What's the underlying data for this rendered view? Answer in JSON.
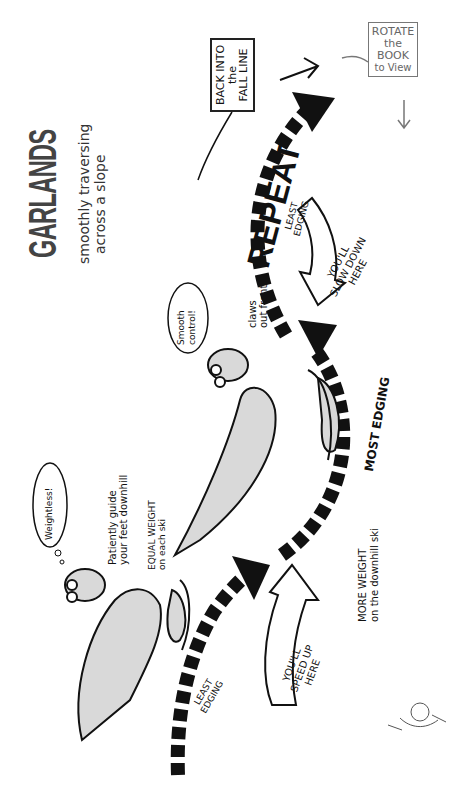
{
  "title": {
    "heading": "GARLANDS",
    "subtitle_line1": "smoothly traversing",
    "subtitle_line2": "across a slope"
  },
  "boxes": {
    "back_into_l1": "BACK INTO",
    "back_into_l2": "the",
    "back_into_l3": "FALL LINE",
    "rotate_l1": "ROTATE",
    "rotate_l2": "the",
    "rotate_l3": "BOOK",
    "rotate_l4": "to View"
  },
  "labels": {
    "repeat": "REPEAT",
    "least_edging_top_l1": "LEAST",
    "least_edging_top_l2": "EDGING",
    "slow_down_l1": "YOU'LL",
    "slow_down_l2": "SLOW DOWN",
    "slow_down_l3": "HERE",
    "most_edging": "MOST EDGING",
    "more_weight_l1": "MORE WEIGHT",
    "more_weight_l2": "on the downhill ski",
    "speed_up_l1": "YOU'LL",
    "speed_up_l2": "SPEED UP",
    "speed_up_l3": "HERE",
    "least_edging_bottom_l1": "LEAST",
    "least_edging_bottom_l2": "EDGING",
    "claws_l1": "claws",
    "claws_l2": "out front",
    "smooth_l1": "Smooth",
    "smooth_l2": "control!",
    "weightless": "Weightless!",
    "patiently_l1": "Patiently guide",
    "patiently_l2": "your feet downhill",
    "equal_l1": "EQUAL WEIGHT",
    "equal_l2": "on each ski"
  },
  "colors": {
    "ink": "#111111",
    "title_gray": "#444444",
    "dino_fill": "#d9d9d9",
    "box_gray": "#777777"
  }
}
